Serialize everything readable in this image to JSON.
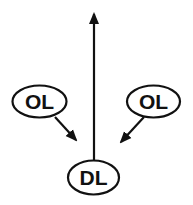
{
  "diagram": {
    "type": "football-blocking-play",
    "colors": {
      "stroke": "#111111",
      "background": "#ffffff"
    },
    "nodes": [
      {
        "id": "ol-left",
        "label": "OL",
        "cx": 39.5,
        "cy": 101.5,
        "rx": 27,
        "ry": 16
      },
      {
        "id": "ol-right",
        "label": "OL",
        "cx": 153.5,
        "cy": 101.5,
        "rx": 26.5,
        "ry": 16
      },
      {
        "id": "dl",
        "label": "DL",
        "cx": 93.5,
        "cy": 177.5,
        "rx": 25.5,
        "ry": 17
      }
    ],
    "arrows": [
      {
        "id": "dl-route",
        "from": [
          94,
          160
        ],
        "to": [
          94,
          10
        ]
      },
      {
        "id": "ol-left-block",
        "from": [
          55,
          117
        ],
        "to": [
          78,
          142
        ]
      },
      {
        "id": "ol-right-block",
        "from": [
          144,
          117
        ],
        "to": [
          119,
          144
        ]
      }
    ]
  }
}
